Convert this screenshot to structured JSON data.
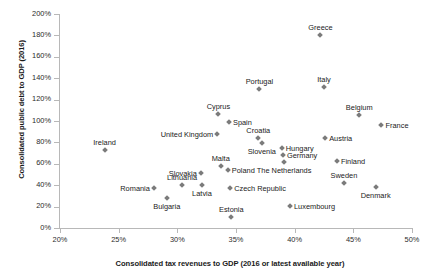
{
  "chart_data": {
    "type": "scatter",
    "title": "",
    "xlabel": "Consolidated tax revenues to GDP (2016 or latest available year)",
    "ylabel": "Consolidated public debt to GDP (2016)",
    "xlim": [
      20,
      50
    ],
    "ylim": [
      0,
      200
    ],
    "xticks": [
      "20%",
      "25%",
      "30%",
      "35%",
      "40%",
      "45%",
      "50%"
    ],
    "xtick_values": [
      20,
      25,
      30,
      35,
      40,
      45,
      50
    ],
    "yticks": [
      "0%",
      "20%",
      "40%",
      "60%",
      "80%",
      "100%",
      "120%",
      "140%",
      "160%",
      "180%",
      "200%"
    ],
    "ytick_values": [
      0,
      20,
      40,
      60,
      80,
      100,
      120,
      140,
      160,
      180,
      200
    ],
    "grid": false,
    "legend": "none",
    "marker_color": "#7b7b7b",
    "points": [
      {
        "label": "Ireland",
        "x": 23.8,
        "y": 73,
        "label_pos": "above"
      },
      {
        "label": "Romania",
        "x": 28.0,
        "y": 37,
        "label_pos": "left"
      },
      {
        "label": "Bulgaria",
        "x": 29.1,
        "y": 28,
        "label_pos": "below"
      },
      {
        "label": "Lithuania",
        "x": 30.4,
        "y": 40,
        "label_pos": "above"
      },
      {
        "label": "Slovakia",
        "x": 32.0,
        "y": 51,
        "label_pos": "left"
      },
      {
        "label": "Latvia",
        "x": 32.1,
        "y": 40,
        "label_pos": "below"
      },
      {
        "label": "United Kingdom",
        "x": 33.4,
        "y": 88,
        "label_pos": "left"
      },
      {
        "label": "Cyprus",
        "x": 33.5,
        "y": 107,
        "label_pos": "above"
      },
      {
        "label": "Malta",
        "x": 33.7,
        "y": 58,
        "label_pos": "above"
      },
      {
        "label": "Poland",
        "x": 34.3,
        "y": 54,
        "label_pos": "right"
      },
      {
        "label": "Spain",
        "x": 34.4,
        "y": 99,
        "label_pos": "right"
      },
      {
        "label": "Czech Republic",
        "x": 34.5,
        "y": 37,
        "label_pos": "right"
      },
      {
        "label": "Estonia",
        "x": 34.6,
        "y": 10,
        "label_pos": "above"
      },
      {
        "label": "Croatia",
        "x": 36.9,
        "y": 84,
        "label_pos": "above"
      },
      {
        "label": "Portugal",
        "x": 37.0,
        "y": 130,
        "label_pos": "above"
      },
      {
        "label": "Slovenia",
        "x": 37.2,
        "y": 79,
        "label_pos": "below"
      },
      {
        "label": "Hungary",
        "x": 38.9,
        "y": 75,
        "label_pos": "right"
      },
      {
        "label": "Germany",
        "x": 39.0,
        "y": 68,
        "label_pos": "right"
      },
      {
        "label": "The Netherlands",
        "x": 39.1,
        "y": 62,
        "label_pos": "below"
      },
      {
        "label": "Luxembourg",
        "x": 39.6,
        "y": 21,
        "label_pos": "right"
      },
      {
        "label": "Greece",
        "x": 42.2,
        "y": 180,
        "label_pos": "above"
      },
      {
        "label": "Italy",
        "x": 42.5,
        "y": 132,
        "label_pos": "above"
      },
      {
        "label": "Austria",
        "x": 42.6,
        "y": 84,
        "label_pos": "right"
      },
      {
        "label": "Finland",
        "x": 43.6,
        "y": 63,
        "label_pos": "right"
      },
      {
        "label": "Sweden",
        "x": 44.2,
        "y": 42,
        "label_pos": "above"
      },
      {
        "label": "Belgium",
        "x": 45.5,
        "y": 106,
        "label_pos": "above"
      },
      {
        "label": "Denmark",
        "x": 46.9,
        "y": 38,
        "label_pos": "below"
      },
      {
        "label": "France",
        "x": 47.4,
        "y": 96,
        "label_pos": "right"
      }
    ]
  }
}
